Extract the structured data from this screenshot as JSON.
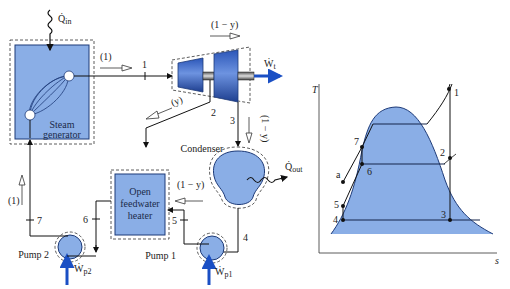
{
  "diagram": {
    "components": {
      "steam_generator": {
        "label_line1": "Steam",
        "label_line2": "generator"
      },
      "turbine": {
        "work_label": "Ẇ",
        "work_sub": "t"
      },
      "condenser": {
        "label": "Condenser"
      },
      "feedwater_heater": {
        "label_line1": "Open",
        "label_line2": "feedwater",
        "label_line3": "heater"
      },
      "pump1": {
        "label": "Pump 1",
        "work_label": "Ẇ",
        "work_sub": "p1"
      },
      "pump2": {
        "label": "Pump 2",
        "work_label": "Ẇ",
        "work_sub": "p2"
      }
    },
    "heat": {
      "q_in": {
        "symbol": "Q̇",
        "sub": "in"
      },
      "q_out": {
        "symbol": "Q̇",
        "sub": "out"
      }
    },
    "flows": {
      "f1": "(1)",
      "f_1_minus_y_top": "(1 − y)",
      "f_y": "(y)",
      "f_1_minus_y_cond": "(1 − y)",
      "f_1_minus_y_fwh": "(1 − y)",
      "f_1_left": "(1)"
    },
    "states": [
      "1",
      "2",
      "3",
      "4",
      "5",
      "6",
      "7"
    ]
  },
  "ts_diagram": {
    "y_axis": "T",
    "x_axis": "s",
    "points": [
      "1",
      "2",
      "3",
      "4",
      "5",
      "6",
      "7",
      "a"
    ],
    "colors": {
      "dome_fill": "#8aaee6",
      "dome_stroke": "#1d3a78"
    }
  }
}
